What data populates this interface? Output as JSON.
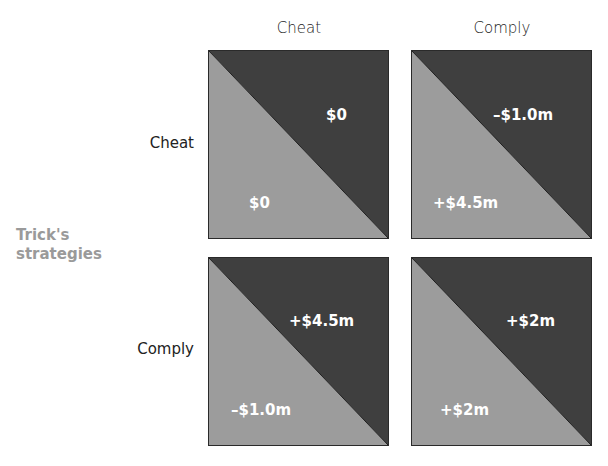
{
  "title_partial": "Rick's strategies",
  "columns": {
    "header": "Rick's strategies",
    "labels": [
      "Cheat",
      "Comply"
    ]
  },
  "rows": {
    "header_line1": "Trick's",
    "header_line2": "strategies",
    "labels": [
      "Cheat",
      "Comply"
    ]
  },
  "colors": {
    "upper_triangle": "#3f3f3f",
    "lower_triangle": "#9c9c9c",
    "border": "#2a2a2a",
    "axis_label": "#9a9a9a",
    "payoff_text": "#ffffff"
  },
  "cells": [
    {
      "row": "Cheat",
      "col": "Cheat",
      "upper": "$0",
      "lower": "$0"
    },
    {
      "row": "Cheat",
      "col": "Comply",
      "upper": "–$1.0m",
      "lower": "+$4.5m"
    },
    {
      "row": "Comply",
      "col": "Cheat",
      "upper": "+$4.5m",
      "lower": "–$1.0m"
    },
    {
      "row": "Comply",
      "col": "Comply",
      "upper": "+$2m",
      "lower": "+$2m"
    }
  ]
}
